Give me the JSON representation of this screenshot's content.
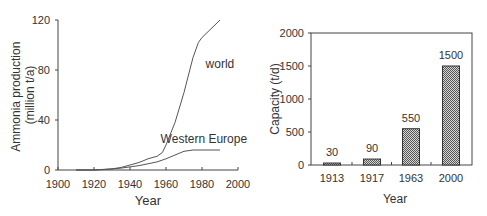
{
  "chart_data": [
    {
      "type": "line",
      "title": "",
      "xlabel": "Year",
      "ylabel": "Ammonia production (million t/a)",
      "ylabel_lines": [
        "Ammonia production",
        "(million t/a)"
      ],
      "xlim": [
        1900,
        2000
      ],
      "ylim": [
        0,
        120
      ],
      "x_ticks": [
        1900,
        1920,
        1940,
        1960,
        1980,
        2000
      ],
      "y_ticks": [
        0,
        40,
        80,
        120
      ],
      "grid": false,
      "series": [
        {
          "name": "world",
          "x": [
            1910,
            1920,
            1925,
            1930,
            1935,
            1940,
            1945,
            1950,
            1955,
            1958,
            1960,
            1965,
            1970,
            1975,
            1978,
            1980,
            1985,
            1990
          ],
          "values": [
            0,
            0,
            0.5,
            1,
            2,
            4,
            6,
            9,
            11,
            14,
            20,
            38,
            62,
            90,
            102,
            106,
            113,
            120
          ]
        },
        {
          "name": "Western Europe",
          "x": [
            1910,
            1920,
            1925,
            1930,
            1935,
            1940,
            1945,
            1950,
            1955,
            1960,
            1965,
            1970,
            1975,
            1980,
            1985,
            1990
          ],
          "values": [
            0,
            0,
            0.3,
            0.8,
            1.5,
            2.5,
            3.5,
            5,
            6.5,
            9,
            12,
            15,
            16,
            16,
            16,
            16
          ]
        }
      ],
      "annotations": [
        {
          "text": "world",
          "x": 1982,
          "y": 82
        },
        {
          "text": "Western Europe",
          "x": 1957,
          "y": 22
        }
      ]
    },
    {
      "type": "bar",
      "title": "",
      "xlabel": "Year",
      "ylabel": "Capacity (t/d)",
      "categories": [
        "1913",
        "1917",
        "1963",
        "2000"
      ],
      "values": [
        30,
        90,
        550,
        1500
      ],
      "data_labels": [
        "30",
        "90",
        "550",
        "1500"
      ],
      "ylim": [
        0,
        2000
      ],
      "y_ticks": [
        0,
        500,
        1000,
        1500,
        2000
      ],
      "grid": false,
      "bar_fill": "#9a9a9a"
    }
  ]
}
